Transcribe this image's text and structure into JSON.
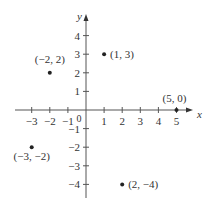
{
  "chart_data": {
    "type": "scatter",
    "title": "",
    "xlabel": "x",
    "ylabel": "y",
    "xlim": [
      -3.5,
      5.5
    ],
    "ylim": [
      -4.8,
      4.8
    ],
    "grid": false,
    "x_ticks": [
      -3,
      -2,
      -1,
      1,
      2,
      3,
      4,
      5
    ],
    "y_ticks": [
      -4,
      -3,
      -2,
      -1,
      1,
      2,
      3,
      4
    ],
    "origin_label": "0",
    "points": [
      {
        "x": 1,
        "y": 3,
        "label": "(1, 3)"
      },
      {
        "x": -2,
        "y": 2,
        "label": "(−2, 2)"
      },
      {
        "x": 5,
        "y": 0,
        "label": "(5, 0)"
      },
      {
        "x": -3,
        "y": -2,
        "label": "(−3, −2)"
      },
      {
        "x": 2,
        "y": -4,
        "label": "(2, −4)"
      }
    ]
  }
}
